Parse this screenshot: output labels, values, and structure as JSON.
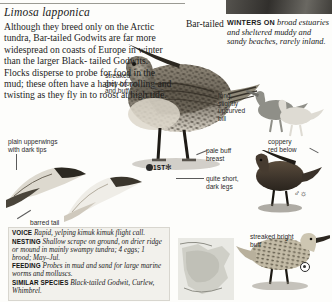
{
  "page": {
    "scientific_name": "Limosa lapponica",
    "common_name": "Bar-tailed",
    "intro_lines": [
      "Although they breed only on the Arctic tundra, Bar-tailed",
      "Godwits are far more widespread on coasts",
      "of Europe in winter than the larger Black-",
      "tailed Godwits. Flocks disperse to probe",
      "for food in the mud;",
      "these often have a habit",
      "of rolling and twisting",
      "as they fly in to roost",
      "at high tide."
    ]
  },
  "winters_note": {
    "caption": "WINTERS ON",
    "text": "broad estuaries and sheltered muddy and sandy beaches, rarely inland."
  },
  "annotations": {
    "streaked_upperparts": "streaked\ngrey-brown\nand buff",
    "plain_upperwings": "plain upperwings\nwith dark tips",
    "barred_tail": "barred tail",
    "long_bill": "long,\nslightly\nupcurved\nbill",
    "coppery": "coppery\nred below",
    "pale_breast": "pale buff\nbreast",
    "short_legs": "quite short,\ndark legs",
    "streaked_buff": "streaked bright\nbuff"
  },
  "symbols": {
    "first_winter": "1ST",
    "snowflake": "✻",
    "male": "♂",
    "sun": "☼"
  },
  "fact_box": {
    "voice": {
      "key": "VOICE",
      "text": "Rapid, yelping kimuk kimuk flight call."
    },
    "nesting": {
      "key": "NESTING",
      "text": "Shallow scrape on ground, on drier ridge or mound in mainly swampy tundra; 4 eggs; 1 brood; May–Jul."
    },
    "feeding": {
      "key": "FEEDING",
      "text": "Probes in mud and sand for large marine worms and molluscs."
    },
    "similar": {
      "key": "SIMILAR SPECIES",
      "text": "Black-tailed Godwit, Curlew, Whimbrel."
    }
  },
  "colors": {
    "page_bg": "#fdfdfb",
    "factbox_bg": "#f2f1ec",
    "rule": "#9a9a93",
    "text": "#1a1a1a",
    "header_bar": "#3a3a3a",
    "map_sea": "#e9e9e4",
    "map_land": "#cfcfc7"
  }
}
